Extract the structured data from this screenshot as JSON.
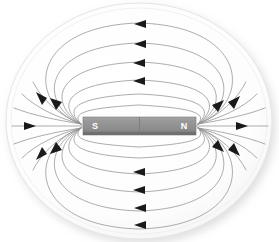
{
  "figure": {
    "name": "bar-magnet-field-lines-diagram",
    "background_color": "#ffffff",
    "plate": {
      "name": "oval-plate",
      "fill": "#fcfcfc",
      "edge_color": "#e2e2e2",
      "shadow_color": "#e8e8e8",
      "cx": 139,
      "cy": 121,
      "rx": 133,
      "ry": 118
    },
    "magnet": {
      "name": "bar-magnet",
      "x": 83,
      "y": 117,
      "width": 113,
      "height": 18,
      "body_color": "#8e8e8e",
      "top_highlight_color": "#a8a8a8",
      "bottom_shadow_color": "#6e6e6e",
      "divider_color": "#7c7c7c",
      "south_label": "S",
      "north_label": "N",
      "south_label_x": 95,
      "north_label_x": 184,
      "label_color": "#ffffff"
    },
    "field": {
      "name": "magnetic-field-lines",
      "line_color": "#909090",
      "line_width": 0.75,
      "arrow_color": "#1a1a1a",
      "arrow_size": 7,
      "direction_note": "lines run from N pole to S pole",
      "axis_line": {
        "y": 126,
        "x_start": 12,
        "x_end": 268,
        "left_arrow_x": 32,
        "right_arrow_x": 243,
        "arrow_direction": "right"
      },
      "upper_arcs": [
        {
          "peak_y": 23,
          "arrow_x": 141,
          "arrow_y": 24
        },
        {
          "peak_y": 43,
          "arrow_x": 141,
          "arrow_y": 44
        },
        {
          "peak_y": 62,
          "arrow_x": 140,
          "arrow_y": 63
        },
        {
          "peak_y": 80,
          "arrow_x": 140,
          "arrow_y": 81
        },
        {
          "peak_y": 94,
          "arrow_x": 0,
          "arrow_y": 0
        },
        {
          "peak_y": 105,
          "arrow_x": 0,
          "arrow_y": 0
        }
      ],
      "lower_arcs": [
        {
          "peak_y": 227,
          "arrow_x": 141,
          "arrow_y": 225
        },
        {
          "peak_y": 210,
          "arrow_x": 141,
          "arrow_y": 208
        },
        {
          "peak_y": 192,
          "arrow_x": 140,
          "arrow_y": 190
        },
        {
          "peak_y": 174,
          "arrow_x": 140,
          "arrow_y": 172
        },
        {
          "peak_y": 158,
          "arrow_x": 0,
          "arrow_y": 0
        },
        {
          "peak_y": 146,
          "arrow_x": 0,
          "arrow_y": 0
        }
      ],
      "pole_arrow_count_left": 5,
      "pole_arrow_count_right": 5
    }
  }
}
